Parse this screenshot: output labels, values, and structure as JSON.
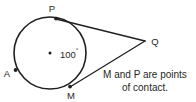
{
  "figure": {
    "background_color": "#ffffff",
    "stroke_color": "#1f1f1f",
    "circle": {
      "center_label": "",
      "center_marker": "center-dot",
      "cx": 50,
      "cy": 53,
      "r": 36
    },
    "points": [
      {
        "id": "P",
        "label": "P",
        "x": 56,
        "y": 19,
        "marker": true,
        "role": "point-of-contact"
      },
      {
        "id": "M",
        "label": "M",
        "x": 70,
        "y": 87,
        "marker": true,
        "role": "point-of-contact"
      },
      {
        "id": "A",
        "label": "A",
        "x": 15,
        "y": 70,
        "marker": true,
        "role": "circle-point"
      },
      {
        "id": "Q",
        "label": "Q",
        "x": 145,
        "y": 41,
        "marker": false,
        "role": "external-vertex"
      }
    ],
    "angle": {
      "value": "100",
      "degree_symbol": "°",
      "full_label": "100°",
      "vertex": "center",
      "x": 60,
      "y": 58
    },
    "segments": [
      {
        "from": "P",
        "to": "Q",
        "kind": "tangent"
      },
      {
        "from": "M",
        "to": "Q",
        "kind": "tangent"
      }
    ],
    "caption": {
      "line1": "M and P are points",
      "line2": "of contact."
    }
  }
}
